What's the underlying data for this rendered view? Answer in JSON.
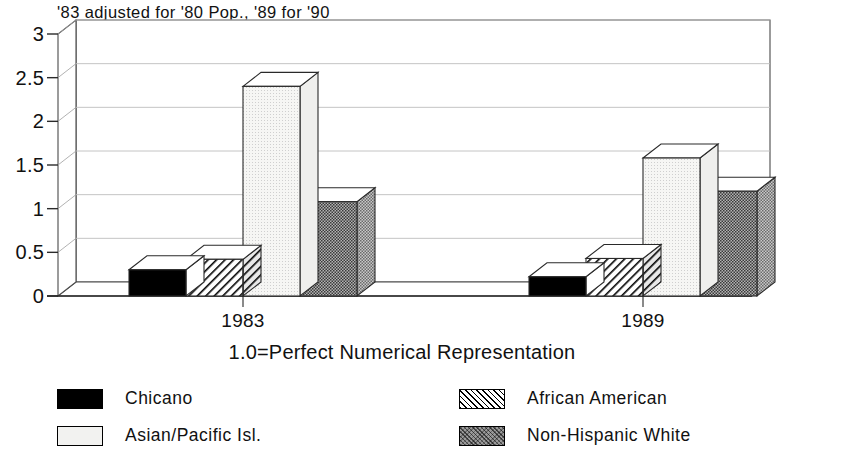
{
  "chart_data": {
    "type": "bar",
    "title": "'83 adjusted for '80 Pop., '89 for '90",
    "xlabel": "1.0=Perfect Numerical Representation",
    "ylabel": "",
    "categories": [
      "1983",
      "1989"
    ],
    "series": [
      {
        "name": "Chicano",
        "values": [
          0.3,
          0.22
        ],
        "fill": "black",
        "color": "#000000"
      },
      {
        "name": "African American",
        "values": [
          0.42,
          0.43
        ],
        "fill": "hatch",
        "color": "#ffffff"
      },
      {
        "name": "Asian/Pacific Isl.",
        "values": [
          2.4,
          1.58
        ],
        "fill": "light",
        "color": "#f2f2f0"
      },
      {
        "name": "Non-Hispanic White",
        "values": [
          1.08,
          1.2
        ],
        "fill": "dark",
        "color": "#9a9a9a"
      }
    ],
    "ylim": [
      0,
      3
    ],
    "yticks": [
      "0",
      "0.5",
      "1",
      "1.5",
      "2",
      "2.5",
      "3"
    ],
    "ytick_values": [
      0,
      0.5,
      1,
      1.5,
      2,
      2.5,
      3
    ],
    "grid": true,
    "legend_position": "bottom",
    "style": "3d-bars"
  },
  "legend": {
    "items": [
      {
        "label": "Chicano",
        "fill": "black"
      },
      {
        "label": "African American",
        "fill": "hatch"
      },
      {
        "label": "Asian/Pacific Isl.",
        "fill": "light"
      },
      {
        "label": "Non-Hispanic White",
        "fill": "dark"
      }
    ]
  }
}
